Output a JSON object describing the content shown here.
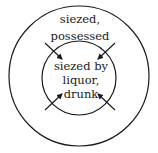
{
  "diagram": {
    "outer_circle": {
      "label_lines": [
        "siezed,",
        "possessed"
      ],
      "cx": 79,
      "cy": 76,
      "r": 70
    },
    "inner_circle": {
      "label_lines": [
        "siezed by",
        "liquor,",
        "drunk"
      ],
      "cx": 79,
      "cy": 78,
      "r": 37
    },
    "arrows": [
      {
        "direction": "inward",
        "from": "top-left"
      },
      {
        "direction": "inward",
        "from": "top-right"
      },
      {
        "direction": "inward",
        "from": "bottom-left"
      },
      {
        "direction": "inward",
        "from": "bottom-right"
      }
    ],
    "stroke_color": "#1a1a1a",
    "background": "#ffffff"
  }
}
